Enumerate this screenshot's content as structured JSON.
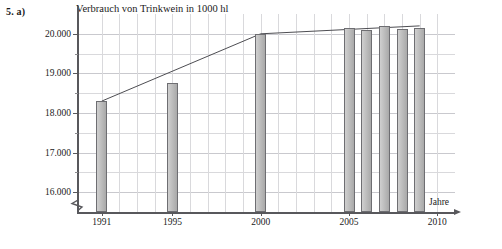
{
  "exercise": {
    "label": "5. a)"
  },
  "axis": {
    "x_title": "Jahre",
    "y_ticks": [
      "16.000",
      "17.000",
      "18.000",
      "19.000",
      "20.000"
    ],
    "x_ticks": [
      "1991",
      "1995",
      "2000",
      "2005",
      "2010"
    ]
  },
  "colors": {
    "bar_fill": "#b7b7b7",
    "bar_stroke": "#6e6e72",
    "grid": "#d9d9dc",
    "axis": "#58585c",
    "text": "#1a1a1a"
  },
  "chart_data": {
    "type": "bar",
    "title": "Verbrauch von Trinkwein in 1000 hl",
    "xlabel": "Jahre",
    "ylabel": "",
    "categories": [
      1991,
      1995,
      2000,
      2005,
      2006,
      2007,
      2008,
      2009
    ],
    "values": [
      18300,
      18750,
      20000,
      20150,
      20100,
      20200,
      20120,
      20150
    ],
    "xlim": [
      1989.6,
      2011.0
    ],
    "ylim": [
      15500,
      20500
    ],
    "y_tick_values": [
      16000,
      17000,
      18000,
      19000,
      20000
    ],
    "y_minor_tick_values": [
      16500,
      17500,
      18500,
      19500
    ],
    "x_tick_values": [
      1991,
      1995,
      2000,
      2005,
      2010
    ],
    "grid": true,
    "legend": "none",
    "axis_break_y": true,
    "overlay": {
      "type": "line",
      "name": "Trendlinie",
      "x": [
        1991,
        2000,
        2009
      ],
      "y": [
        18300,
        20000,
        20200
      ]
    }
  }
}
